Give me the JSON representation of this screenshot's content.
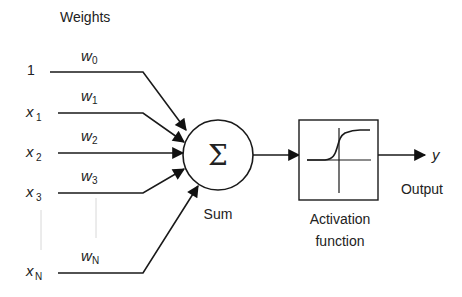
{
  "title": "Weights",
  "inputs": [
    {
      "main": "1",
      "sub": "",
      "weight_main": "w",
      "weight_sub": "0"
    },
    {
      "main": "x",
      "sub": "1",
      "weight_main": "w",
      "weight_sub": "1"
    },
    {
      "main": "x",
      "sub": "2",
      "weight_main": "w",
      "weight_sub": "2"
    },
    {
      "main": "x",
      "sub": "3",
      "weight_main": "w",
      "weight_sub": "3"
    },
    {
      "main": "x",
      "sub": "N",
      "weight_main": "w",
      "weight_sub": "N"
    }
  ],
  "sum_node": {
    "symbol": "Σ",
    "label": "Sum"
  },
  "activation": {
    "label_line1": "Activation",
    "label_line2": "function"
  },
  "output": {
    "symbol": "y",
    "label": "Output"
  }
}
